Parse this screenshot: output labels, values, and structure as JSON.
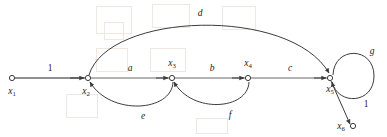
{
  "figure": {
    "stroke_color": "#3c3c3c",
    "text_color": "#1a1a1a",
    "background": "#ffffff"
  },
  "nodes": [
    {
      "id": "x1",
      "label": "x",
      "sub": "1",
      "x": 12,
      "y": 78,
      "label_x": 12,
      "label_y": 92
    },
    {
      "id": "x2",
      "label": "x",
      "sub": "2",
      "x": 88,
      "y": 78,
      "label_x": 86,
      "label_y": 92
    },
    {
      "id": "x3",
      "label": "x",
      "sub": "3",
      "x": 172,
      "y": 78,
      "label_x": 172,
      "label_y": 64
    },
    {
      "id": "x4",
      "label": "x",
      "sub": "4",
      "x": 248,
      "y": 78,
      "label_x": 248,
      "label_y": 64
    },
    {
      "id": "x5",
      "label": "x",
      "sub": "5",
      "x": 330,
      "y": 78,
      "label_x": 330,
      "label_y": 90
    },
    {
      "id": "x6",
      "label": "x",
      "sub": "6",
      "x": 353,
      "y": 126,
      "label_x": 341,
      "label_y": 127
    }
  ],
  "branches": [
    {
      "id": "x1-x2",
      "from": "x1",
      "to": "x2",
      "gain": "1",
      "gain_x": 50,
      "gain_y": 69,
      "gain_style": "upright",
      "shape": "straight"
    },
    {
      "id": "x2-x3",
      "from": "x2",
      "to": "x3",
      "gain": "a",
      "gain_x": 130,
      "gain_y": 69,
      "gain_style": "italic",
      "shape": "straight"
    },
    {
      "id": "x3-x4",
      "from": "x3",
      "to": "x4",
      "gain": "b",
      "gain_x": 212,
      "gain_y": 69,
      "gain_style": "italic",
      "shape": "straight"
    },
    {
      "id": "x4-x5",
      "from": "x4",
      "to": "x5",
      "gain": "c",
      "gain_x": 290,
      "gain_y": 69,
      "gain_style": "italic",
      "shape": "straight"
    },
    {
      "id": "x2-x5",
      "from": "x2",
      "to": "x5",
      "gain": "d",
      "gain_x": 200,
      "gain_y": 14,
      "gain_style": "italic",
      "shape": "arc-above"
    },
    {
      "id": "x3-x2",
      "from": "x3",
      "to": "x2",
      "gain": "e",
      "gain_x": 143,
      "gain_y": 117,
      "gain_style": "italic",
      "shape": "arc-below"
    },
    {
      "id": "x4-x3",
      "from": "x4",
      "to": "x3",
      "gain": "f",
      "gain_x": 230,
      "gain_y": 116,
      "gain_style": "italic",
      "shape": "arc-below"
    },
    {
      "id": "x5-x5",
      "from": "x5",
      "to": "x5",
      "gain": "g",
      "gain_x": 372,
      "gain_y": 52,
      "gain_style": "italic",
      "shape": "self-loop"
    },
    {
      "id": "x5-x6",
      "from": "x5",
      "to": "x6",
      "gain": "1",
      "gain_x": 366,
      "gain_y": 105,
      "gain_style": "upright",
      "shape": "straight"
    }
  ]
}
